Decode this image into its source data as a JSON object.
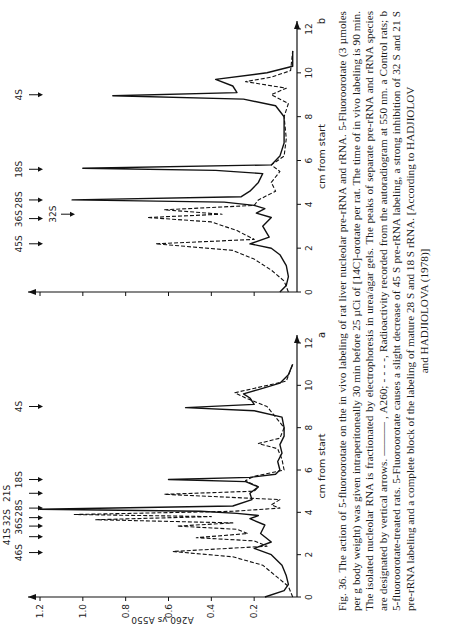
{
  "figure": {
    "number": "Fig. 36.",
    "caption_lines": [
      "The action of 5-fluoroorotate on the in vivo labeling of rat liver nucleolar pre-rRNA and rRNA. 5-Fluoroorotate (3 µmoles per g body weight) was given intraperitoneally 30 min before 25 µCi of [14C]-orotate per rat. The time of in vivo labeling is 90 min. The isolated nucleolar RNA is fractionated by electrophoresis in urea/agar gels. The peaks of separate pre-rRNA and rRNA species are designated by vertical arrows. ——— , A260; - - - -, Radioactivity recorded from the autoradiogram at 550 nm. a Control rats; b 5-fluoroorotate-treated rats. 5-Fluoroorotate causes a slight decrease of 45 S pre-rRNA labeling, a strong inhibition of 32 S and 21 S pre-rRNA labeling and a complete block of the labeling of mature 28 S and 18 S rRNA. [According to HADJIOLOV"
    ],
    "caption_last": "and HADJIOLOVA (1978)]"
  },
  "chart_data": [
    {
      "panel": "a",
      "type": "line",
      "title": "a Control rats",
      "xlabel": "cm from start",
      "ylabel": "A260 vs A550",
      "xlim": [
        0,
        12
      ],
      "ylim": [
        0,
        1.2
      ],
      "x_ticks": [
        0,
        2,
        4,
        6,
        8,
        10,
        12
      ],
      "y_ticks": [
        0.2,
        0.4,
        0.6,
        0.8,
        1.0,
        1.2
      ],
      "grid": false,
      "arrows": [
        {
          "label": "46S",
          "x": 2.1
        },
        {
          "label": "41S",
          "x": 2.85
        },
        {
          "label": "36S",
          "x": 3.35
        },
        {
          "label": "32S",
          "x": 3.75
        },
        {
          "label": "28S",
          "x": 4.2
        },
        {
          "label": "21S",
          "x": 4.9
        },
        {
          "label": "18S",
          "x": 5.55
        },
        {
          "label": "4S",
          "x": 9.0
        }
      ],
      "series": [
        {
          "name": "A260 (solid)",
          "style": "solid",
          "x": [
            0,
            0.3,
            0.6,
            1.0,
            1.5,
            2.0,
            2.3,
            2.6,
            3.0,
            3.4,
            3.7,
            3.85,
            3.95,
            4.05,
            4.15,
            4.3,
            4.6,
            4.9,
            5.2,
            5.45,
            5.55,
            5.65,
            5.8,
            6.0,
            6.4,
            6.8,
            7.2,
            7.6,
            8.0,
            8.5,
            8.8,
            8.95,
            9.1,
            9.4,
            9.6,
            9.8,
            10.1,
            10.5,
            11.0
          ],
          "y": [
            0.15,
            0.06,
            0.04,
            0.05,
            0.07,
            0.12,
            0.2,
            0.12,
            0.17,
            0.15,
            0.22,
            0.18,
            0.28,
            0.45,
            1.2,
            0.3,
            0.21,
            0.22,
            0.18,
            0.24,
            0.6,
            0.22,
            0.1,
            0.08,
            0.09,
            0.07,
            0.08,
            0.06,
            0.06,
            0.07,
            0.2,
            0.52,
            0.2,
            0.22,
            0.25,
            0.18,
            0.08,
            0.04,
            0.02
          ]
        },
        {
          "name": "Radioactivity A550 (dashed)",
          "style": "dashed",
          "x": [
            0,
            0.5,
            1.0,
            1.5,
            1.9,
            2.15,
            2.4,
            2.65,
            2.8,
            3.0,
            3.2,
            3.35,
            3.5,
            3.65,
            3.8,
            3.9,
            4.05,
            4.2,
            4.35,
            4.6,
            4.85,
            5.0,
            5.2,
            5.5,
            5.7,
            6.0,
            6.5,
            7.0,
            7.25,
            7.5,
            8.0,
            8.5,
            9.0,
            9.4,
            9.65,
            9.9,
            10.2,
            11.0
          ],
          "y": [
            0.02,
            0.04,
            0.1,
            0.16,
            0.3,
            0.58,
            0.14,
            0.2,
            0.47,
            0.23,
            0.28,
            0.56,
            0.3,
            0.94,
            0.4,
            1.04,
            0.3,
            0.08,
            0.12,
            0.08,
            0.62,
            0.2,
            0.18,
            0.24,
            0.2,
            0.06,
            0.07,
            0.09,
            0.18,
            0.08,
            0.06,
            0.1,
            0.14,
            0.24,
            0.29,
            0.18,
            0.05,
            0.02
          ]
        }
      ]
    },
    {
      "panel": "b",
      "type": "line",
      "title": "b 5-fluoroorotate-treated rats",
      "xlabel": "cm from start",
      "ylabel": "A260 vs A550",
      "xlim": [
        0,
        12
      ],
      "ylim": [
        0,
        1.2
      ],
      "x_ticks": [
        0,
        2,
        4,
        6,
        8,
        10,
        12
      ],
      "y_ticks": [
        0.2,
        0.4,
        0.6,
        0.8,
        1.0,
        1.2
      ],
      "grid": false,
      "arrows": [
        {
          "label": "45S",
          "x": 2.2
        },
        {
          "label": "36S",
          "x": 3.35
        },
        {
          "label": "32S",
          "x": 3.55
        },
        {
          "label": "28S",
          "x": 4.2
        },
        {
          "label": "18S",
          "x": 5.6
        },
        {
          "label": "4S",
          "x": 9.0
        }
      ],
      "series": [
        {
          "name": "A260 (solid)",
          "style": "solid",
          "x": [
            0,
            0.3,
            0.7,
            1.2,
            1.7,
            2.0,
            2.2,
            2.5,
            3.0,
            3.4,
            3.6,
            3.8,
            3.95,
            4.1,
            4.2,
            4.35,
            4.6,
            5.0,
            5.4,
            5.55,
            5.65,
            5.8,
            6.2,
            6.8,
            7.4,
            8.0,
            8.5,
            8.8,
            8.95,
            9.1,
            9.4,
            9.7,
            10.0,
            10.3,
            11.0
          ],
          "y": [
            0.08,
            0.05,
            0.04,
            0.05,
            0.08,
            0.12,
            0.22,
            0.13,
            0.16,
            0.12,
            0.19,
            0.15,
            0.2,
            0.34,
            1.05,
            0.26,
            0.22,
            0.18,
            0.16,
            0.38,
            1.0,
            0.12,
            0.08,
            0.06,
            0.06,
            0.06,
            0.1,
            0.25,
            0.86,
            0.28,
            0.3,
            0.38,
            0.14,
            0.02,
            0.02
          ]
        },
        {
          "name": "Radioactivity A550 (dashed)",
          "style": "dashed",
          "x": [
            0,
            0.5,
            1.0,
            1.5,
            1.9,
            2.2,
            2.4,
            2.8,
            3.2,
            3.4,
            3.55,
            3.75,
            3.95,
            4.2,
            4.6,
            5.0,
            5.5,
            5.8,
            6.2,
            7.0,
            8.0,
            8.6,
            9.0,
            9.3,
            9.6,
            9.8,
            10.1,
            11.0
          ],
          "y": [
            0.04,
            0.06,
            0.12,
            0.2,
            0.3,
            0.66,
            0.2,
            0.28,
            0.4,
            0.7,
            0.35,
            0.62,
            0.2,
            0.18,
            0.1,
            0.12,
            0.08,
            0.12,
            0.06,
            0.05,
            0.06,
            0.04,
            0.12,
            0.05,
            0.24,
            0.12,
            0.03,
            0.02
          ]
        }
      ]
    }
  ]
}
